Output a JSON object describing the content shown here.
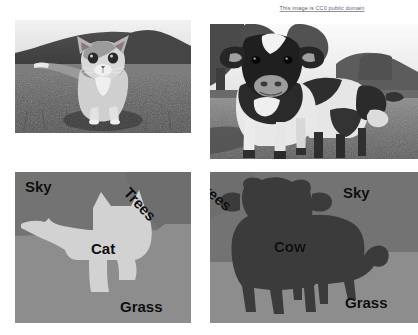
{
  "attribution": {
    "prefix": "This image is ",
    "link_text": "CC0 public domain",
    "full_text": "This image is CC0 public domain"
  },
  "panels": {
    "photo_cat": {
      "name": "kitten-photo",
      "description": "Grayscale photograph of a kitten walking through grass with trees and sky behind"
    },
    "photo_cow": {
      "name": "cows-photo",
      "description": "Grayscale photograph of two Holstein cows standing in a field with trees and sky behind"
    },
    "seg_cat": {
      "name": "kitten-segmentation",
      "labels": {
        "sky": "Sky",
        "trees": "Trees",
        "object": "Cat",
        "grass": "Grass"
      }
    },
    "seg_cow": {
      "name": "cows-segmentation",
      "labels": {
        "trees": "Trees",
        "sky": "Sky",
        "object": "Cow",
        "grass": "Grass"
      }
    }
  },
  "colors": {
    "background": "#ffffff",
    "sky_region": "#737373",
    "trees_region": "#6e6e6e",
    "grass_region": "#8d8d8d",
    "cat_region": "#d2d2d2",
    "cow_region": "#3b3b3b",
    "label_text": "#0d0d0d",
    "attribution_link": "#5f5f72"
  }
}
